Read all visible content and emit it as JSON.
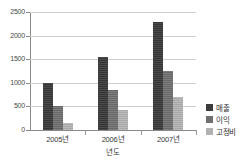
{
  "chart_data": {
    "type": "bar",
    "title": "",
    "xlabel": "년도",
    "ylabel": "",
    "categories": [
      "2005년",
      "2006년",
      "2007년"
    ],
    "series": [
      {
        "name": "매출",
        "color": "#3c3c3c",
        "values": [
          1000,
          1550,
          2280
        ]
      },
      {
        "name": "이익",
        "color": "#707070",
        "values": [
          500,
          850,
          1250
        ]
      },
      {
        "name": "고정비",
        "color": "#b2b2b2",
        "values": [
          150,
          420,
          700
        ]
      }
    ],
    "ylim": [
      0,
      2500
    ],
    "ytick_labels": [
      "0",
      "500",
      "1000",
      "1500",
      "2000",
      "2500"
    ],
    "ytick_values": [
      0,
      500,
      1000,
      1500,
      2000,
      2500
    ],
    "grid": true,
    "legend_position": "right"
  }
}
